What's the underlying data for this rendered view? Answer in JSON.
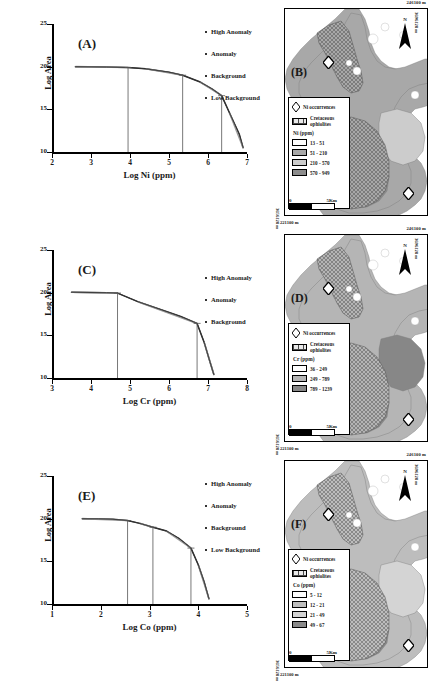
{
  "figure": {
    "axis_y_label": "Log Area",
    "y_ticks": [
      "10",
      "15",
      "20",
      "25"
    ],
    "map_coord_top": "246100 m",
    "map_coord_bottom": "221100 m",
    "map_coord_right_top": "3696128 m",
    "map_coord_right_bottom": "3696128 m",
    "map_coord_left": "3656128 m",
    "north_label": "N",
    "scale_zero": "0",
    "scale_max": "5Km",
    "occurrences_label": "Ni occurrences",
    "ophiolites_label": "Cretaceous ophiolites"
  },
  "panels": [
    {
      "id": "(A)",
      "kind": "chart",
      "element": "Ni",
      "xlabel": "Log Ni (ppm)",
      "x_ticks": [
        "2",
        "3",
        "4",
        "5",
        "6",
        "7"
      ],
      "legend": [
        "High Anomaly",
        "Anomaly",
        "Background",
        "Low Background"
      ]
    },
    {
      "id": "(B)",
      "kind": "map",
      "element": "Ni",
      "legend_title": "Ni (ppm)",
      "classes": [
        "13 - 51",
        "51 - 210",
        "210 - 570",
        "570 - 949"
      ],
      "colors": [
        "#ffffff",
        "#a8a8a8",
        "#cccccc",
        "#8c8c8c"
      ]
    },
    {
      "id": "(C)",
      "kind": "chart",
      "element": "Cr",
      "xlabel": "Log Cr (ppm)",
      "x_ticks": [
        "3",
        "4",
        "5",
        "6",
        "7",
        "8"
      ],
      "legend": [
        "High Anomaly",
        "Anomaly",
        "Background"
      ]
    },
    {
      "id": "(D)",
      "kind": "map",
      "element": "Cr",
      "legend_title": "Cr (ppm)",
      "classes": [
        "36 - 249",
        "249 - 789",
        "789 - 1239"
      ],
      "colors": [
        "#ffffff",
        "#b5b5b5",
        "#878787"
      ]
    },
    {
      "id": "(E)",
      "kind": "chart",
      "element": "Co",
      "xlabel": "Log Co (ppm)",
      "x_ticks": [
        "1",
        "2",
        "3",
        "4",
        "5"
      ],
      "legend": [
        "High Anomaly",
        "Anomaly",
        "Background",
        "Low Background"
      ]
    },
    {
      "id": "(F)",
      "kind": "map",
      "element": "Co",
      "legend_title": "Co (ppm)",
      "classes": [
        "5 - 12",
        "12 - 21",
        "21 - 49",
        "49 - 67"
      ],
      "colors": [
        "#ffffff",
        "#bdbdbd",
        "#d4d4d4",
        "#8a8a8a"
      ]
    }
  ],
  "chart_data": [
    {
      "type": "line",
      "title": "(A)",
      "xlabel": "Log Ni (ppm)",
      "ylabel": "Log Area",
      "xlim": [
        2,
        7
      ],
      "ylim": [
        10,
        25
      ],
      "grid": false,
      "legend_position": "top-right",
      "legend": [
        "High Anomaly",
        "Anomaly",
        "Background",
        "Low Background"
      ],
      "x": [
        2.6,
        3.0,
        3.4,
        3.95,
        4.4,
        5.0,
        5.35,
        5.8,
        6.1,
        6.35,
        6.55,
        6.7,
        6.8,
        6.9
      ],
      "y": [
        20.0,
        19.98,
        19.95,
        19.9,
        19.75,
        19.35,
        19.0,
        18.2,
        17.4,
        16.6,
        14.6,
        13.1,
        12.1,
        10.5
      ],
      "breaks": [
        3.95,
        5.35,
        6.35
      ],
      "break_labels": [
        "Low Background",
        "Background",
        "Anomaly"
      ]
    },
    {
      "type": "line",
      "title": "(C)",
      "xlabel": "Log Cr (ppm)",
      "ylabel": "Log Area",
      "xlim": [
        3,
        8
      ],
      "ylim": [
        10,
        25
      ],
      "grid": false,
      "legend_position": "top-right",
      "legend": [
        "High Anomaly",
        "Anomaly",
        "Background"
      ],
      "x": [
        3.5,
        4.0,
        4.4,
        4.68,
        5.2,
        5.8,
        6.3,
        6.72,
        6.9,
        7.05,
        7.15
      ],
      "y": [
        20.05,
        20.02,
        20.0,
        19.95,
        18.95,
        18.0,
        17.2,
        16.4,
        14.2,
        11.9,
        10.4
      ],
      "breaks": [
        4.68,
        6.72
      ],
      "break_labels": [
        "Background",
        "Anomaly"
      ]
    },
    {
      "type": "line",
      "title": "(E)",
      "xlabel": "Log Co (ppm)",
      "ylabel": "Log Area",
      "xlim": [
        1,
        5
      ],
      "ylim": [
        10,
        25
      ],
      "grid": false,
      "legend_position": "top-right",
      "legend": [
        "High Anomaly",
        "Anomaly",
        "Background",
        "Low Background"
      ],
      "x": [
        1.62,
        1.95,
        2.25,
        2.55,
        2.8,
        3.07,
        3.35,
        3.6,
        3.85,
        4.0,
        4.12,
        4.22
      ],
      "y": [
        20.0,
        19.97,
        19.93,
        19.78,
        19.45,
        19.0,
        18.55,
        17.7,
        16.55,
        14.6,
        12.6,
        10.6
      ],
      "breaks": [
        2.55,
        3.07,
        3.85
      ],
      "break_labels": [
        "Low Background",
        "Background",
        "Anomaly"
      ]
    }
  ]
}
